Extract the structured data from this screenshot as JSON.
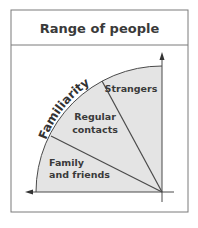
{
  "title": "Range of people",
  "axis_label": "Familiarity",
  "segments": [
    {
      "label_line1": "Strangers",
      "label_line2": ""
    },
    {
      "label_line1": "Regular",
      "label_line2": "contacts"
    },
    {
      "label_line1": "Family",
      "label_line2": "and friends"
    }
  ],
  "colors": {
    "border": "#7a7a7a",
    "fill": "#e4e4e4",
    "line": "#4a4a4a",
    "text": "#3a3a3a"
  }
}
